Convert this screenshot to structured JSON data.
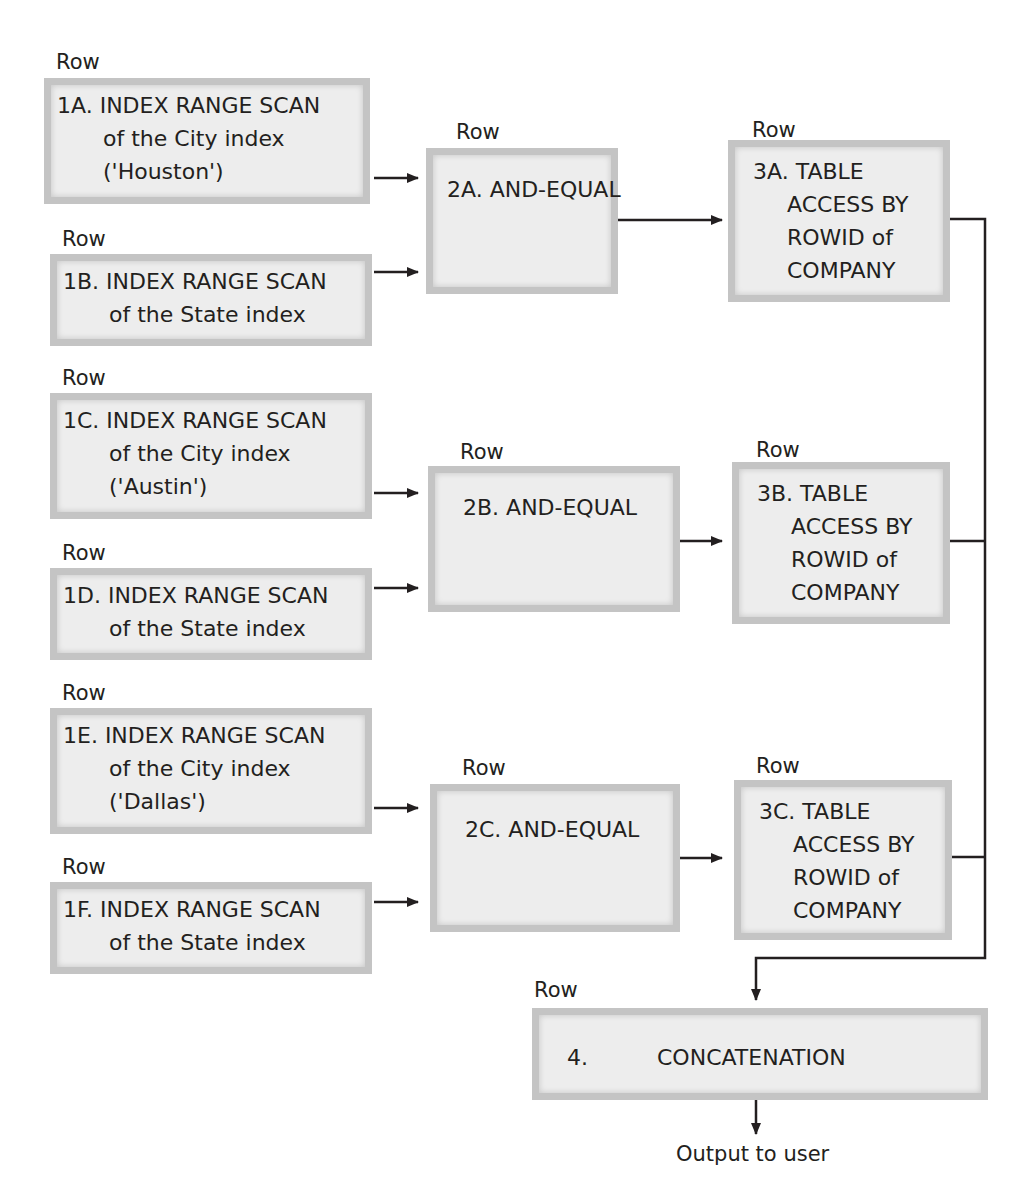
{
  "diagram": {
    "row_label": "Row",
    "step1": [
      {
        "id": "1A",
        "lines": [
          "1A. INDEX RANGE SCAN",
          "of the City index",
          "('Houston')"
        ]
      },
      {
        "id": "1B",
        "lines": [
          "1B. INDEX RANGE SCAN",
          "of the State index"
        ]
      },
      {
        "id": "1C",
        "lines": [
          "1C. INDEX RANGE SCAN",
          "of the City index",
          "('Austin')"
        ]
      },
      {
        "id": "1D",
        "lines": [
          "1D. INDEX RANGE SCAN",
          "of the State index"
        ]
      },
      {
        "id": "1E",
        "lines": [
          "1E. INDEX RANGE SCAN",
          "of the City index",
          "('Dallas')"
        ]
      },
      {
        "id": "1F",
        "lines": [
          "1F. INDEX RANGE SCAN",
          "of the State index"
        ]
      }
    ],
    "step2": [
      {
        "id": "2A",
        "label": "2A. AND-EQUAL"
      },
      {
        "id": "2B",
        "label": "2B. AND-EQUAL"
      },
      {
        "id": "2C",
        "label": "2C. AND-EQUAL"
      }
    ],
    "step3": [
      {
        "id": "3A",
        "lines": [
          "3A. TABLE",
          "ACCESS BY",
          "ROWID of",
          "COMPANY"
        ]
      },
      {
        "id": "3B",
        "lines": [
          "3B. TABLE",
          "ACCESS BY",
          "ROWID of",
          "COMPANY"
        ]
      },
      {
        "id": "3C",
        "lines": [
          "3C. TABLE",
          "ACCESS BY",
          "ROWID of",
          "COMPANY"
        ]
      }
    ],
    "step4": {
      "num": "4.",
      "label": "CONCATENATION"
    },
    "output": "Output to user",
    "colors": {
      "box_fill": "#ededed",
      "box_border": "#c4c4c4",
      "line": "#231f20"
    }
  }
}
